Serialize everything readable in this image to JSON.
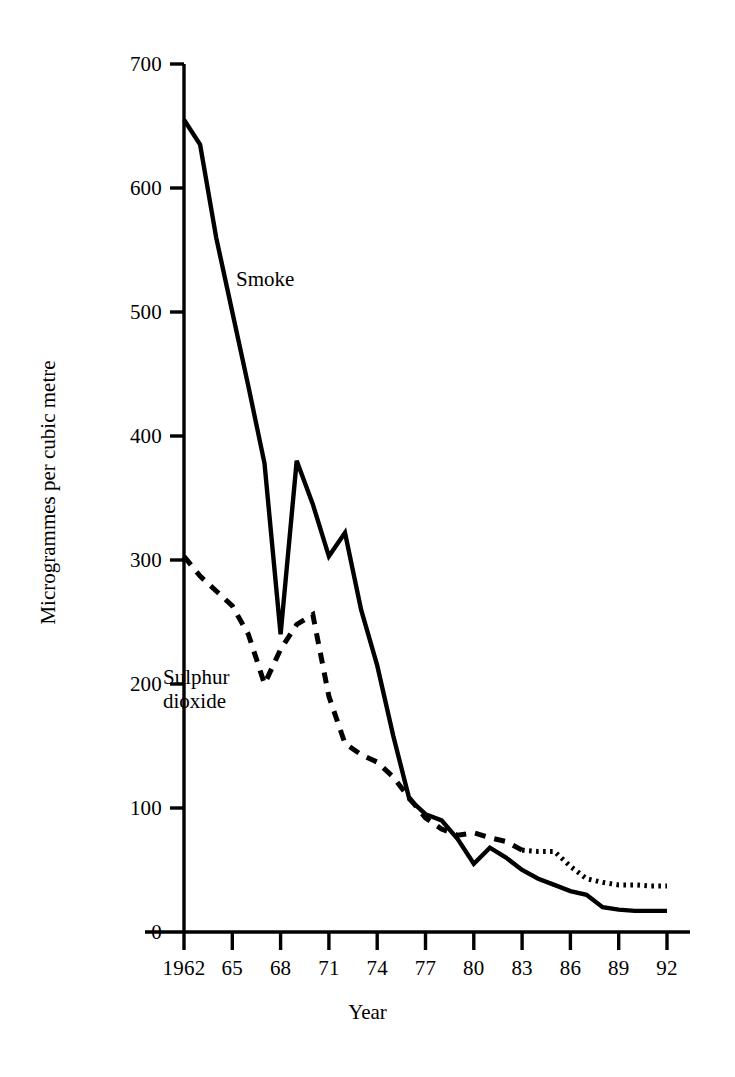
{
  "chart_data": {
    "type": "line",
    "title": "",
    "xlabel": "Year",
    "ylabel": "Microgrammes per cubic metre",
    "xlim": [
      1962,
      1992
    ],
    "ylim": [
      0,
      700
    ],
    "grid": false,
    "legend": "inline-annotations",
    "x_tick_labels": [
      "1962",
      "65",
      "68",
      "71",
      "74",
      "77",
      "80",
      "83",
      "86",
      "89",
      "92"
    ],
    "x_tick_values": [
      1962,
      1965,
      1968,
      1971,
      1974,
      1977,
      1980,
      1983,
      1986,
      1989,
      1992
    ],
    "y_tick_labels": [
      "0",
      "100",
      "200",
      "300",
      "400",
      "500",
      "600",
      "700"
    ],
    "y_tick_values": [
      0,
      100,
      200,
      300,
      400,
      500,
      600,
      700
    ],
    "x": [
      1962,
      1963,
      1964,
      1965,
      1966,
      1967,
      1968,
      1969,
      1970,
      1971,
      1972,
      1973,
      1974,
      1975,
      1976,
      1977,
      1978,
      1979,
      1980,
      1981,
      1982,
      1983,
      1984,
      1985,
      1986,
      1987,
      1988,
      1989,
      1990,
      1991,
      1992
    ],
    "series": [
      {
        "name": "Smoke",
        "style": "solid",
        "color": "#000000",
        "values": [
          655,
          635,
          560,
          500,
          440,
          378,
          240,
          380,
          345,
          303,
          322,
          260,
          215,
          158,
          107,
          95,
          90,
          75,
          55,
          68,
          60,
          50,
          43,
          38,
          33,
          30,
          20,
          18,
          17,
          17,
          17
        ]
      },
      {
        "name": "Sulphur dioxide",
        "style": "dashed-then-dotted",
        "color": "#000000",
        "values": [
          303,
          287,
          275,
          263,
          240,
          200,
          228,
          248,
          256,
          190,
          152,
          143,
          137,
          125,
          108,
          92,
          83,
          78,
          80,
          76,
          73,
          66,
          65,
          65,
          53,
          43,
          40,
          38,
          38,
          37,
          37
        ]
      }
    ],
    "annotations": [
      {
        "id": "smoke",
        "text": "Smoke",
        "x": 1964.5,
        "y": 520
      },
      {
        "id": "sulphur-dioxide",
        "text_line1": "Sulphur",
        "text_line2": "dioxide",
        "x": 1962.6,
        "y": 190
      }
    ]
  },
  "axis": {
    "y_title": "Microgrammes per cubic metre",
    "x_title": "Year"
  }
}
